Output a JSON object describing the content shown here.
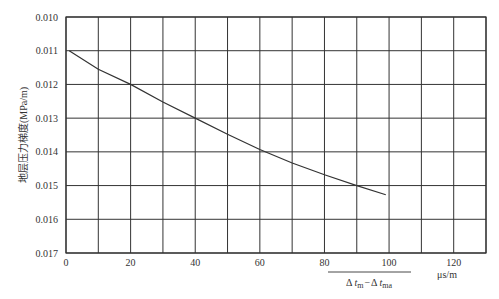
{
  "chart_data": {
    "type": "line",
    "title": "",
    "ylabel": "地层压力梯度(MPa/m)",
    "xlabel": "Δt_m − Δt_ma",
    "xlabel_parts": {
      "delta1": "Δ",
      "t1": "t",
      "sub1": "m",
      "minus": "−",
      "delta2": "Δ",
      "t2": "t",
      "sub2": "ma"
    },
    "x_unit": "μs/m",
    "xlim": [
      0,
      130
    ],
    "ylim": [
      0.01,
      0.017
    ],
    "y_inverted": true,
    "grid": true,
    "x_ticks": [
      0,
      20,
      40,
      60,
      80,
      100,
      120
    ],
    "x_tick_labels": [
      "0",
      "20",
      "40",
      "60",
      "80",
      "100",
      "120"
    ],
    "x_gridlines": [
      0,
      10,
      20,
      30,
      40,
      50,
      60,
      70,
      80,
      90,
      100,
      110,
      120,
      130
    ],
    "y_ticks": [
      0.01,
      0.011,
      0.012,
      0.013,
      0.014,
      0.015,
      0.016,
      0.017
    ],
    "y_tick_labels": [
      "0.010",
      "0.011",
      "0.012",
      "0.013",
      "0.014",
      "0.015",
      "0.016",
      "0.017"
    ],
    "series": [
      {
        "name": "pressure gradient curve",
        "x": [
          1,
          10,
          20,
          30,
          40,
          50,
          60,
          70,
          80,
          90,
          99
        ],
        "y": [
          0.011,
          0.01155,
          0.012,
          0.01252,
          0.013,
          0.01348,
          0.01393,
          0.01433,
          0.01468,
          0.015,
          0.01527
        ],
        "color": "#333333"
      }
    ]
  }
}
